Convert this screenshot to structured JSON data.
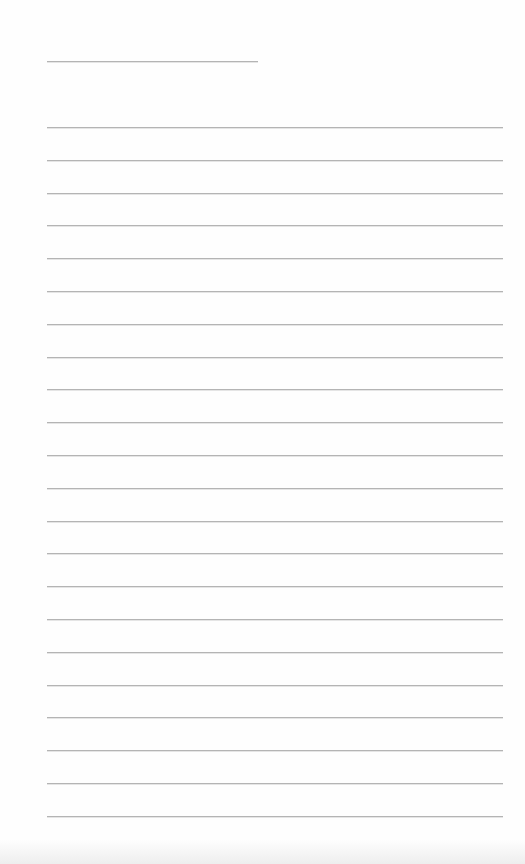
{
  "page": {
    "type": "lined-notepaper",
    "background_color": "#fefefe",
    "line_color": "#b4b4b4",
    "title_line": {
      "text": ""
    },
    "ruled_lines": [
      {
        "text": ""
      },
      {
        "text": ""
      },
      {
        "text": ""
      },
      {
        "text": ""
      },
      {
        "text": ""
      },
      {
        "text": ""
      },
      {
        "text": ""
      },
      {
        "text": ""
      },
      {
        "text": ""
      },
      {
        "text": ""
      },
      {
        "text": ""
      },
      {
        "text": ""
      },
      {
        "text": ""
      },
      {
        "text": ""
      },
      {
        "text": ""
      },
      {
        "text": ""
      },
      {
        "text": ""
      },
      {
        "text": ""
      },
      {
        "text": ""
      },
      {
        "text": ""
      },
      {
        "text": ""
      },
      {
        "text": ""
      }
    ]
  }
}
